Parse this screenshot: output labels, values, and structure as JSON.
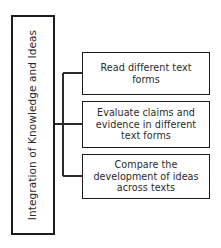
{
  "diagram": {
    "title": "Integration of Knowledge and Ideas",
    "type": "horizontal-tree",
    "background_color": "#ffffff",
    "line_color": "#2b2b2b",
    "text_color": "#2b2b2b",
    "root": {
      "label": "Integration of Knowledge and Ideas",
      "orientation": "vertical-rotated"
    },
    "branches": [
      {
        "id": "read",
        "label": "Read different text forms"
      },
      {
        "id": "evaluate",
        "label": "Evaluate claims and evidence in different text forms"
      },
      {
        "id": "compare",
        "label": "Compare the development of ideas across texts"
      }
    ]
  }
}
